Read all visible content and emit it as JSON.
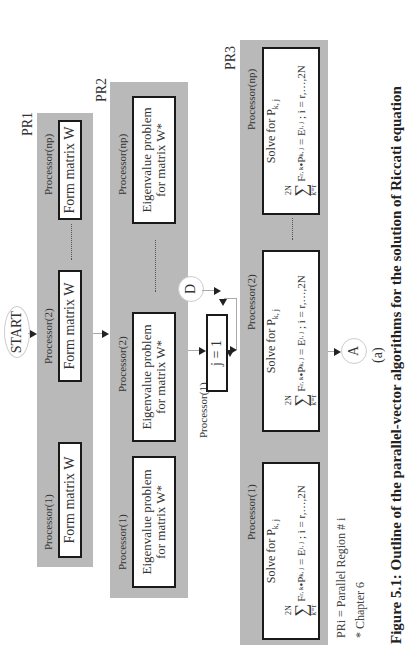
{
  "diagram": {
    "start_label": "START",
    "regions": {
      "pr1": {
        "label": "PR1",
        "processors": [
          {
            "label": "Processor(1)",
            "task": "Form matrix W"
          },
          {
            "label": "Processor(2)",
            "task": "Form matrix W"
          },
          {
            "label": "Processor(np)",
            "task": "Form matrix W"
          }
        ]
      },
      "pr2": {
        "label": "PR2",
        "processors": [
          {
            "label": "Processor(1)",
            "task_line1": "Eigenvalue problem",
            "task_line2": "for matrix W*"
          },
          {
            "label": "Processor(2)",
            "task_line1": "Eigenvalue problem",
            "task_line2": "for matrix W*"
          },
          {
            "label": "Processor(np)",
            "task_line1": "Eigenvalue problem",
            "task_line2": "for matrix W*"
          }
        ]
      },
      "serial": {
        "label": "Processor(1)",
        "task": "j = 1"
      },
      "pr3": {
        "label": "PR3",
        "processors": [
          {
            "label": "Processor(1)",
            "title": "Solve for P",
            "title_sub": "k, j",
            "sum_upper": "2N",
            "sum_lower": "k=r",
            "eq_text": "F",
            "eq_text_sub": "r, k",
            "eq_mid": "•P",
            "eq_mid_sub": "k, j",
            "eq_rhs": " = E",
            "eq_rhs_sub": "i, j",
            "eq_tail": " ; i = r,…,2N"
          },
          {
            "label": "Processor(2)",
            "title": "Solve for P",
            "title_sub": "k, j",
            "sum_upper": "2N",
            "sum_lower": "k=r",
            "eq_text": "F",
            "eq_text_sub": "r, k",
            "eq_mid": "•P",
            "eq_mid_sub": "k, j",
            "eq_rhs": " = E",
            "eq_rhs_sub": "i, j",
            "eq_tail": " ; i = r,…,2N"
          },
          {
            "label": "Processor(np)",
            "title": "Solve for P",
            "title_sub": "k, j",
            "sum_upper": "2N",
            "sum_lower": "k=r",
            "eq_text": "F",
            "eq_text_sub": "r, k",
            "eq_mid": "•P",
            "eq_mid_sub": "k, j",
            "eq_rhs": " = E",
            "eq_rhs_sub": "i, j",
            "eq_tail": " ; i = r,…,2N"
          }
        ]
      }
    },
    "connectors": {
      "d_label": "D",
      "a_label": "A"
    },
    "legend": {
      "line1": "PRi = Parallel Region # i",
      "line2": "*  Chapter 6"
    },
    "subfigure_label": "(a)",
    "caption": "Figure 5.1:  Outline of the parallel-vector algorithms for the solution of Riccati equation"
  }
}
